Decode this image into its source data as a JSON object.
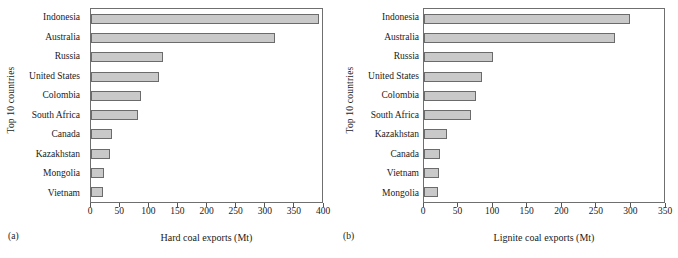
{
  "figure": {
    "panels": [
      {
        "tag": "(a)",
        "y_axis_title": "Top 10 countries",
        "x_axis_title": "Hard coal exports (Mt)",
        "chart_data": {
          "type": "bar",
          "orientation": "horizontal",
          "title": "",
          "xlabel": "Hard coal exports (Mt)",
          "ylabel": "Top 10 countries",
          "xlim": [
            0,
            400
          ],
          "xticks": [
            0,
            50,
            100,
            150,
            200,
            250,
            300,
            350,
            400
          ],
          "xtick_labels": [
            "0",
            "50",
            "100",
            "150",
            "200",
            "250",
            "300",
            "350",
            "400"
          ],
          "grid": false,
          "legend": "none",
          "categories": [
            "Indonesia",
            "Australia",
            "Russia",
            "United States",
            "Colombia",
            "South Africa",
            "Canada",
            "Kazakhstan",
            "Mongolia",
            "Vietnam"
          ],
          "values": [
            395,
            318,
            125,
            117,
            86,
            81,
            36,
            33,
            22,
            20
          ],
          "bar_fill_color": "#c9c9c9",
          "bar_edge_color": "#6b6b6b"
        }
      },
      {
        "tag": "(b)",
        "y_axis_title": "Top 10 countries",
        "x_axis_title": "Lignite coal exports (Mt)",
        "chart_data": {
          "type": "bar",
          "orientation": "horizontal",
          "title": "",
          "xlabel": "Lignite coal exports (Mt)",
          "ylabel": "Top 10 countries",
          "xlim": [
            0,
            350
          ],
          "xticks": [
            0,
            50,
            100,
            150,
            200,
            250,
            300,
            350
          ],
          "xtick_labels": [
            "0",
            "50",
            "100",
            "150",
            "200",
            "250",
            "300",
            "350"
          ],
          "grid": false,
          "legend": "none",
          "categories": [
            "Indonesia",
            "Australia",
            "Russia",
            "United States",
            "Colombia",
            "South Africa",
            "Kazakhstan",
            "Canada",
            "Vietnam",
            "Mongolia"
          ],
          "values": [
            301,
            278,
            100,
            84,
            76,
            69,
            34,
            23,
            22,
            20
          ],
          "bar_fill_color": "#c9c9c9",
          "bar_edge_color": "#6b6b6b"
        }
      }
    ]
  }
}
